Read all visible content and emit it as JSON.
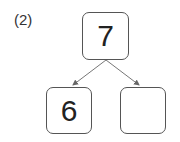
{
  "problem_label": "(2)",
  "number_bond": {
    "whole": "7",
    "parts": [
      "6",
      ""
    ]
  },
  "colors": {
    "border": "#555555",
    "arrow": "#666666",
    "text": "#222222"
  }
}
